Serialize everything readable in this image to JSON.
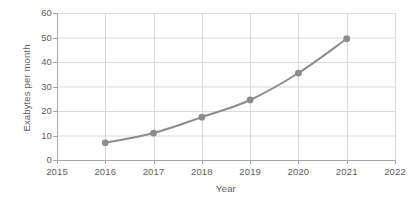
{
  "chart_data": {
    "type": "line",
    "title": "",
    "subtitle": "",
    "xlabel": "Year",
    "ylabel": "Exabytes per month",
    "x": [
      2016,
      2017,
      2018,
      2019,
      2020,
      2021
    ],
    "values": [
      7,
      11,
      17.5,
      24.5,
      35.5,
      49.5
    ],
    "series": [
      {
        "name": "Exabytes per month",
        "x": [
          2016,
          2017,
          2018,
          2019,
          2020,
          2021
        ],
        "values": [
          7,
          11,
          17.5,
          24.5,
          35.5,
          49.5
        ]
      }
    ],
    "x_tick_labels": [
      "2015",
      "2016",
      "2017",
      "2018",
      "2019",
      "2020",
      "2021",
      "2022"
    ],
    "x_tick_values": [
      2015,
      2016,
      2017,
      2018,
      2019,
      2020,
      2021,
      2022
    ],
    "y_tick_labels": [
      "0",
      "10",
      "20",
      "30",
      "40",
      "50",
      "60"
    ],
    "y_tick_values": [
      0,
      10,
      20,
      30,
      40,
      50,
      60
    ],
    "xlim": [
      2015,
      2022
    ],
    "ylim": [
      0,
      60
    ],
    "grid": true,
    "grid_x": true,
    "grid_y": true,
    "legend": false,
    "legend_position": "none",
    "marker": "circle",
    "annotations": [],
    "colors": {
      "line": "#8c8c8c",
      "marker": "#8c8c8c",
      "grid": "#d9d9d9",
      "axis": "#a6a6a6",
      "text": "#5e5e5e",
      "background": "#ffffff"
    }
  }
}
